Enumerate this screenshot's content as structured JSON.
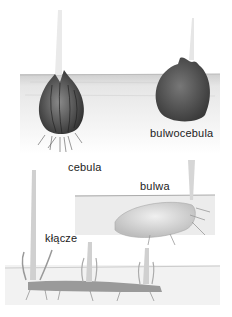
{
  "labels": {
    "cebula": "cebula",
    "bulwocebula": "bulwocebula",
    "bulwa": "bulwa",
    "klacze": "kłącze"
  },
  "colors": {
    "soil": "#e4e4e4",
    "bulb": "#4a4a4a",
    "corm": "#5a5a5a",
    "tuber": "#d8d8d8",
    "sprout": "#d0d0d0"
  }
}
